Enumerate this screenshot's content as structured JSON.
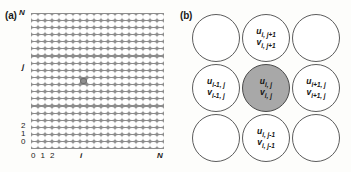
{
  "figure": {
    "panels": [
      {
        "id": "a",
        "label": "(a)",
        "description": "Square lattice of nodes with one highlighted interior node"
      },
      {
        "id": "b",
        "label": "(b)",
        "description": "Five-point stencil of neighbouring nodes around node i,j"
      }
    ]
  },
  "panel_a": {
    "label": "(a)",
    "lattice": {
      "columns": 19,
      "rows": 19,
      "highlighted_node": {
        "col": 7,
        "row": 9
      }
    },
    "y_axis": {
      "ticks_top_to_bottom": [
        "N",
        "j",
        "2",
        "1",
        "0"
      ]
    },
    "x_axis": {
      "ticks_left_to_right": [
        "0 1 2",
        "i",
        "N"
      ],
      "origin_group": "0 1 2",
      "mid": "i",
      "max": "N"
    }
  },
  "panel_b": {
    "label": "(b)",
    "nodes": [
      {
        "position": "top-left",
        "row": 0,
        "col": 0,
        "highlighted": false,
        "u": "",
        "u_sub": "",
        "v": "",
        "v_sub": ""
      },
      {
        "position": "top-center",
        "row": 0,
        "col": 1,
        "highlighted": false,
        "u": "u",
        "u_sub": "i, j+1",
        "v": "v",
        "v_sub": "i, j+1"
      },
      {
        "position": "top-right",
        "row": 0,
        "col": 2,
        "highlighted": false,
        "u": "",
        "u_sub": "",
        "v": "",
        "v_sub": ""
      },
      {
        "position": "middle-left",
        "row": 1,
        "col": 0,
        "highlighted": false,
        "u": "u",
        "u_sub": "i-1, j",
        "v": "v",
        "v_sub": "i-1, j"
      },
      {
        "position": "middle-center",
        "row": 1,
        "col": 1,
        "highlighted": true,
        "u": "u",
        "u_sub": "i, j",
        "v": "v",
        "v_sub": "i, j"
      },
      {
        "position": "middle-right",
        "row": 1,
        "col": 2,
        "highlighted": false,
        "u": "u",
        "u_sub": "i+1, j",
        "v": "v",
        "v_sub": "i+1, j"
      },
      {
        "position": "bottom-left",
        "row": 2,
        "col": 0,
        "highlighted": false,
        "u": "",
        "u_sub": "",
        "v": "",
        "v_sub": ""
      },
      {
        "position": "bottom-center",
        "row": 2,
        "col": 1,
        "highlighted": false,
        "u": "u",
        "u_sub": "i, j-1",
        "v": "v",
        "v_sub": "i, j-1"
      },
      {
        "position": "bottom-right",
        "row": 2,
        "col": 2,
        "highlighted": false,
        "u": "",
        "u_sub": "",
        "v": "",
        "v_sub": ""
      }
    ]
  },
  "colors": {
    "highlight_fill": "#a8a8a8",
    "node_stroke": "#5c5c5c",
    "lattice_background": "#8c8c8c",
    "node_fill": "#ffffff",
    "text": "#141414",
    "page_background": "#fdfdfb"
  }
}
